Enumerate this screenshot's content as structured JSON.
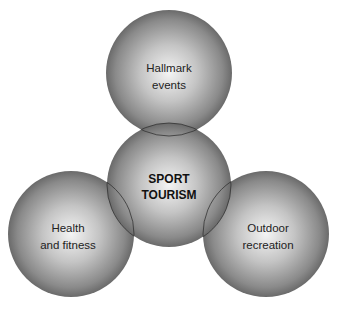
{
  "diagram": {
    "colors": {
      "sphere_center": "#f2f2f2",
      "sphere_mid": "#b0b0b0",
      "sphere_edge": "#6e6e6e",
      "outline": "#333333",
      "background": "#ffffff"
    },
    "nodes": [
      {
        "id": "hallmark",
        "lines": [
          "Hallmark",
          "events"
        ],
        "cx": 169,
        "cy": 73,
        "r": 63
      },
      {
        "id": "sport-tourism",
        "lines": [
          "SPORT",
          "TOURISM"
        ],
        "cx": 169,
        "cy": 185,
        "r": 62,
        "bold": true
      },
      {
        "id": "health",
        "lines": [
          "Health",
          "and fitness"
        ],
        "cx": 71,
        "cy": 234,
        "r": 63
      },
      {
        "id": "outdoor",
        "lines": [
          "Outdoor",
          "recreation"
        ],
        "cx": 266,
        "cy": 234,
        "r": 63
      }
    ]
  }
}
